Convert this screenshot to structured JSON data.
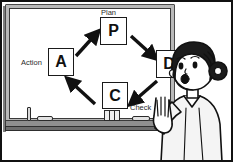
{
  "scene": {
    "title": "PDCA cycle explained on a whiteboard",
    "kind": "illustration",
    "background_color": "#ffffff",
    "outline_color": "#111111"
  },
  "whiteboard": {
    "frame_color": "#b9b9b9",
    "surface_color": "#ffffff",
    "tray_color": "#8f8f8f",
    "tray_items": [
      {
        "name": "marker",
        "orientation": "vertical"
      },
      {
        "name": "eraser",
        "orientation": "horizontal"
      },
      {
        "name": "marker-pair",
        "orientation": "vertical"
      },
      {
        "name": "eraser",
        "orientation": "horizontal"
      }
    ]
  },
  "diagram": {
    "name": "PDCA cycle",
    "nodes": [
      {
        "id": "plan",
        "letter": "P",
        "label": "Plan",
        "label_position": "above"
      },
      {
        "id": "do",
        "letter": "D",
        "label": "Do",
        "label_position": "right"
      },
      {
        "id": "check",
        "letter": "C",
        "label": "Check",
        "label_position": "below-right"
      },
      {
        "id": "action",
        "letter": "A",
        "label": "Action",
        "label_position": "left"
      }
    ],
    "arrows": [
      {
        "from": "action",
        "to": "plan",
        "direction": "up-right"
      },
      {
        "from": "plan",
        "to": "do",
        "direction": "down-right"
      },
      {
        "from": "do",
        "to": "check",
        "direction": "down-left"
      },
      {
        "from": "check",
        "to": "action",
        "direction": "up-left"
      }
    ],
    "stroke_color": "#1a1a1a",
    "text_color": "#2a2a2a"
  },
  "person": {
    "name": "presenter",
    "description": "woman with hair bun raising her hand, speaking",
    "hair_color": "#1b1b1b",
    "skin_color": "#ffffff",
    "clothing_color": "#f2f2f2",
    "pose": "hand-raised"
  }
}
